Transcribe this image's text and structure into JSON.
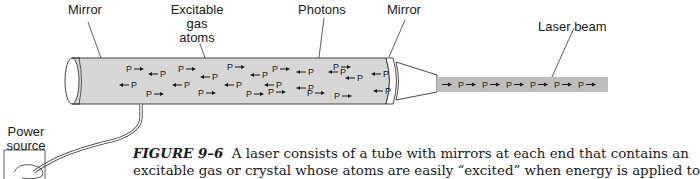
{
  "labels": {
    "mirror_left": "Mirror",
    "excitable_line1": "Excitable",
    "excitable_line2": "gas",
    "excitable_line3": "atoms",
    "photons": "Photons",
    "mirror_right": "Mirror",
    "laser_beam": "Laser beam",
    "power_line1": "Power",
    "power_line2": "source"
  },
  "photon_glyph": "P",
  "tube_photons": [
    {
      "x": 126,
      "y": 69,
      "dir": "right"
    },
    {
      "x": 148,
      "y": 74,
      "dir": "left"
    },
    {
      "x": 178,
      "y": 69,
      "dir": "right"
    },
    {
      "x": 200,
      "y": 77,
      "dir": "left"
    },
    {
      "x": 227,
      "y": 67,
      "dir": "right"
    },
    {
      "x": 250,
      "y": 75,
      "dir": "left"
    },
    {
      "x": 272,
      "y": 69,
      "dir": "right"
    },
    {
      "x": 296,
      "y": 72,
      "dir": "left"
    },
    {
      "x": 328,
      "y": 72,
      "dir": "left"
    },
    {
      "x": 333,
      "y": 67,
      "dir": "right"
    },
    {
      "x": 345,
      "y": 78,
      "dir": "left"
    },
    {
      "x": 371,
      "y": 74,
      "dir": "left"
    },
    {
      "x": 119,
      "y": 85,
      "dir": "left"
    },
    {
      "x": 146,
      "y": 94,
      "dir": "right"
    },
    {
      "x": 172,
      "y": 85,
      "dir": "left"
    },
    {
      "x": 198,
      "y": 93,
      "dir": "right"
    },
    {
      "x": 224,
      "y": 85,
      "dir": "left"
    },
    {
      "x": 246,
      "y": 94,
      "dir": "right"
    },
    {
      "x": 264,
      "y": 85,
      "dir": "left"
    },
    {
      "x": 268,
      "y": 92,
      "dir": "right"
    },
    {
      "x": 296,
      "y": 88,
      "dir": "left"
    },
    {
      "x": 307,
      "y": 93,
      "dir": "right"
    },
    {
      "x": 334,
      "y": 96,
      "dir": "right"
    },
    {
      "x": 373,
      "y": 91,
      "dir": "left"
    }
  ],
  "beam_photons_count": 6,
  "caption": {
    "figure_label": "FIGURE 9–6",
    "line1": "A laser consists of a tube with mirrors at each end that contains an",
    "line2": "excitable gas or crystal whose atoms are easily “excited” when energy is applied to"
  },
  "colors": {
    "tube_fill": "#d6d6d6",
    "beam_fill": "#bdbdbd",
    "stroke": "#333333"
  }
}
